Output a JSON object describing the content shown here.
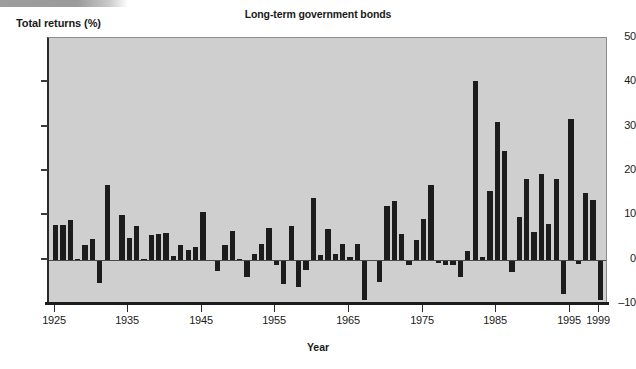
{
  "figure": {
    "title": "Long-term government bonds",
    "ylabel": "Total returns (%)",
    "xlabel": "Year"
  },
  "chart_data": {
    "type": "bar",
    "title": "Long-term government bonds",
    "xlabel": "Year",
    "ylabel": "Total returns (%)",
    "ylim": [
      -10,
      50
    ],
    "xlim": [
      1925,
      1999
    ],
    "yticks": [
      -10,
      0,
      10,
      20,
      30,
      40,
      50
    ],
    "xticks": [
      1925,
      1935,
      1945,
      1955,
      1965,
      1975,
      1985,
      1995,
      1999
    ],
    "grid": false,
    "legend": null,
    "bar_color": "#1c1c1c",
    "plot_background": "#cfcfcf",
    "categories": [
      1925,
      1926,
      1927,
      1928,
      1929,
      1930,
      1931,
      1932,
      1933,
      1934,
      1935,
      1936,
      1937,
      1938,
      1939,
      1940,
      1941,
      1942,
      1943,
      1944,
      1945,
      1946,
      1947,
      1948,
      1949,
      1950,
      1951,
      1952,
      1953,
      1954,
      1955,
      1956,
      1957,
      1958,
      1959,
      1960,
      1961,
      1962,
      1963,
      1964,
      1965,
      1966,
      1967,
      1968,
      1969,
      1970,
      1971,
      1972,
      1973,
      1974,
      1975,
      1976,
      1977,
      1978,
      1979,
      1980,
      1981,
      1982,
      1983,
      1984,
      1985,
      1986,
      1987,
      1988,
      1989,
      1990,
      1991,
      1992,
      1993,
      1994,
      1995,
      1996,
      1997,
      1998,
      1999
    ],
    "values": [
      7.9,
      7.8,
      8.9,
      0.1,
      3.4,
      4.7,
      -5.3,
      16.8,
      -0.1,
      10.0,
      5.0,
      7.5,
      0.2,
      5.5,
      5.9,
      6.1,
      0.9,
      3.2,
      2.1,
      2.8,
      10.7,
      -0.1,
      -2.6,
      3.4,
      6.5,
      0.1,
      -3.9,
      1.2,
      3.6,
      7.2,
      -1.3,
      -5.6,
      7.5,
      -6.1,
      -2.3,
      13.8,
      1.0,
      6.9,
      1.2,
      3.5,
      0.7,
      3.6,
      -9.2,
      -0.3,
      -5.1,
      12.1,
      13.2,
      5.7,
      -1.1,
      4.4,
      9.2,
      16.8,
      -0.7,
      -1.2,
      -1.2,
      -4.0,
      1.9,
      40.4,
      0.7,
      15.5,
      31.0,
      24.5,
      -2.7,
      9.7,
      18.1,
      6.2,
      19.3,
      8.1,
      18.2,
      -7.8,
      31.7,
      -0.9,
      15.1,
      13.5,
      -9.0
    ]
  }
}
